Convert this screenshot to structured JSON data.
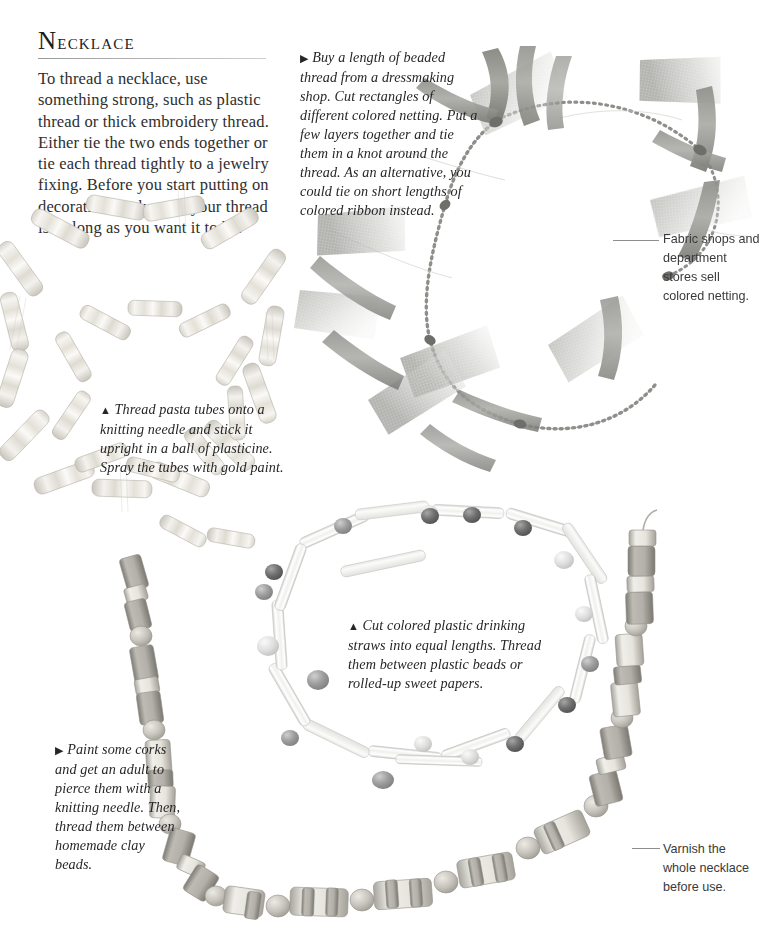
{
  "page": {
    "heading": "Necklace",
    "heading_initial": "N",
    "heading_rest": "ecklace",
    "body_text": "To thread a necklace, use something strong, such as plastic thread or thick embroidery thread. Either tie the two ends together or tie each thread tightly to a jewelry fixing. Before you start putting on decoration, make sure your thread is as long as you want it to be.",
    "background_color": "#ffffff",
    "text_color": "#2e2e2e",
    "rule_color": "#9a9a9a"
  },
  "captions": {
    "netting": {
      "marker": "▶",
      "text": "Buy a length of beaded thread from a dressmaking shop. Cut rectangles of different colored netting. Put a few layers together and tie them in a knot around the thread. As an alternative, you could tie on short lengths of colored ribbon instead."
    },
    "pasta": {
      "marker": "▲",
      "text": "Thread pasta tubes onto a knitting needle and stick it upright in a ball of plasticine. Spray the tubes with gold paint."
    },
    "straws": {
      "marker": "▲",
      "text": "Cut colored plastic drinking straws into equal lengths. Thread them between plastic beads or rolled-up sweet papers."
    },
    "corks": {
      "marker": "▶",
      "text": "Paint some corks and get an adult to pierce them with a knitting needle. Then, thread them between homemade clay beads."
    }
  },
  "annotations": {
    "fabric": "Fabric shops and department stores sell colored netting.",
    "varnish": "Varnish the whole necklace before use."
  },
  "artwork": {
    "netting_necklace": {
      "label": "beaded thread with colored netting and ribbon",
      "ribbon_color": "#9a9a96",
      "netting_color": "#b9b9b4",
      "bead_color": "#8d8d8a"
    },
    "pasta_necklace": {
      "label": "spiral of gold-sprayed pasta tubes",
      "tube_color": "#eeece6",
      "tube_shade": "#c9c6bd"
    },
    "straw_necklace": {
      "label": "plastic drinking straw lengths with plastic beads",
      "straw_color": "#f1f1ef",
      "bead_dark": "#6f6f6f",
      "bead_mid": "#9d9d9d",
      "bead_light": "#d9d9d6"
    },
    "cork_necklace": {
      "label": "painted pierced corks with homemade clay beads",
      "cork_light": "#e8e6e0",
      "cork_mid": "#b5b3ab",
      "cork_dark": "#8e8c85",
      "clay_bead": "#c4c2ba"
    }
  }
}
